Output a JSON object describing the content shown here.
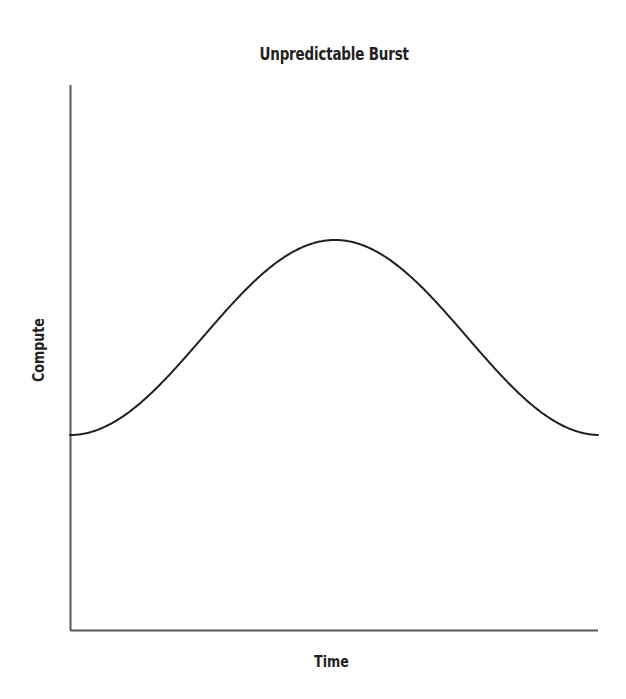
{
  "chart_data": {
    "type": "line",
    "title": "Unpredictable Burst",
    "xlabel": "Time",
    "ylabel": "Compute",
    "grid": false,
    "legend": null,
    "xticklabels": [],
    "yticklabels": [],
    "xlim": [
      0,
      2.32
    ],
    "ylim": [
      0,
      1
    ],
    "axis_color": "#58595b",
    "line_color": "#231f20",
    "line_width": 2,
    "background": "#ffffff",
    "series": [
      {
        "name": "Compute over time",
        "x": [
          0.0,
          0.08,
          0.16,
          0.24,
          0.32,
          0.4,
          0.48,
          0.56,
          0.64,
          0.72,
          0.8,
          0.88,
          0.96,
          1.04,
          1.12,
          1.2,
          1.28,
          1.36,
          1.44,
          1.52,
          1.6,
          1.68,
          1.76,
          1.84,
          1.92,
          2.0,
          2.08,
          2.16,
          2.24,
          2.32
        ],
        "y": [
          0.0,
          0.02,
          0.07,
          0.16,
          0.27,
          0.4,
          0.55,
          0.69,
          0.82,
          0.92,
          0.98,
          1.0,
          0.98,
          0.92,
          0.82,
          0.69,
          0.55,
          0.4,
          0.27,
          0.16,
          0.07,
          0.02,
          0.0,
          0.02,
          0.07,
          0.16,
          0.27,
          0.4,
          0.55,
          0.69
        ]
      }
    ],
    "peaks": [
      {
        "x_px": 196,
        "y_px": 240,
        "label": "first peak"
      },
      {
        "x_px": 465,
        "y_px": 240,
        "label": "second peak"
      }
    ],
    "troughs": [
      {
        "x_px": 335,
        "y_px": 435,
        "label": "mid trough"
      }
    ],
    "baseline_y_px": 435,
    "axes_pixels": {
      "origin_x": 70,
      "origin_y": 630,
      "y_axis_top": 85,
      "x_axis_right": 598
    }
  }
}
